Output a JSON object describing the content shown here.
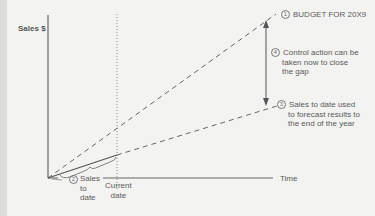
{
  "diagram": {
    "y_axis_label": "Sales $",
    "x_axis_label": "Time",
    "current_date_label": "Current date",
    "annotations": [
      {
        "number": "1",
        "text": "BUDGET FOR 20X9"
      },
      {
        "number": "2",
        "text": "Sales to date"
      },
      {
        "number": "3",
        "text": "Sales to date used to forecast results to the end of the year"
      },
      {
        "number": "4",
        "text": "Control action can be taken now to close the gap"
      }
    ],
    "sales_to_date_lines": [
      "Sales",
      "to",
      "date"
    ],
    "current_date_lines": [
      "Current",
      "date"
    ],
    "note3_lines": [
      "Sales to date used",
      "to forecast results to",
      "the end of the year"
    ],
    "note4_lines": [
      "Control action can be",
      "taken now to close",
      "the gap"
    ],
    "colors": {
      "background": "#f3f3f1",
      "line": "#666666",
      "text": "#5a5a5a"
    }
  }
}
